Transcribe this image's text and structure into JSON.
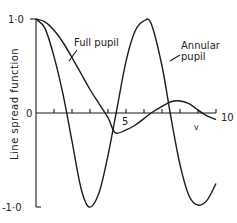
{
  "chart_data": {
    "type": "line",
    "title": "",
    "xlabel": "v",
    "ylabel": "Line spread function",
    "xlim": [
      0,
      10
    ],
    "ylim": [
      -1.0,
      1.0
    ],
    "x_ticks": [
      0,
      1,
      2,
      3,
      4,
      5,
      6,
      7,
      8,
      9,
      10
    ],
    "x_tick_labels": {
      "5": "5",
      "10": "10"
    },
    "y_tick_labels": [
      "1·0",
      "0",
      "-1·0"
    ],
    "grid": false,
    "legend": "none (inline annotations)",
    "series": [
      {
        "name": "Full pupil",
        "x": [
          0,
          0.5,
          1,
          1.5,
          2,
          2.5,
          3,
          3.5,
          4,
          4.4,
          5,
          5.5,
          6,
          6.4,
          7,
          7.5,
          7.9,
          8.5,
          9,
          9.5,
          10
        ],
        "y": [
          1.0,
          0.97,
          0.88,
          0.75,
          0.59,
          0.42,
          0.25,
          0.1,
          -0.05,
          -0.21,
          -0.18,
          -0.13,
          -0.06,
          0.0,
          0.07,
          0.12,
          0.13,
          0.1,
          0.03,
          -0.03,
          -0.07
        ]
      },
      {
        "name": "Annular pupil",
        "x": [
          0,
          0.5,
          1,
          1.5,
          2,
          2.5,
          2.95,
          3.5,
          4,
          4.5,
          5,
          5.5,
          6,
          6.4,
          7,
          7.5,
          8,
          8.5,
          9,
          9.5,
          10
        ],
        "y": [
          1.0,
          0.9,
          0.6,
          0.2,
          -0.3,
          -0.8,
          -1.0,
          -0.85,
          -0.45,
          0.05,
          0.55,
          0.87,
          0.98,
          0.95,
          0.5,
          -0.05,
          -0.55,
          -0.88,
          -0.98,
          -0.93,
          -0.75
        ]
      }
    ],
    "annotations": [
      {
        "text": "Full pupil",
        "points_to": "Full pupil curve"
      },
      {
        "text": "Annular pupil",
        "points_to": "Annular pupil curve"
      }
    ]
  },
  "labels": {
    "y_top": "1·0",
    "y_zero": "0",
    "y_bottom": "-1·0",
    "x_five": "5",
    "x_ten": "10",
    "x_axis": "v",
    "y_axis": "Line spread function",
    "full_pupil": "Full pupil",
    "annular_line1": "Annular",
    "annular_line2": "pupil"
  }
}
